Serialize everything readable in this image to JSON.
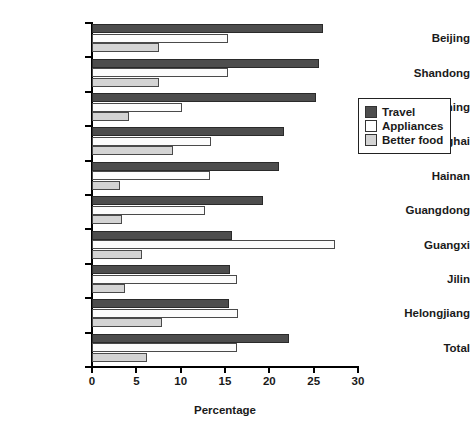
{
  "chart_data": {
    "type": "bar",
    "orientation": "horizontal",
    "title": "",
    "xlabel": "Percentage",
    "ylabel": "",
    "xlim": [
      0,
      30
    ],
    "xticks": [
      0,
      5,
      10,
      15,
      20,
      25,
      30
    ],
    "grid": false,
    "legend_position": "right",
    "categories": [
      "Beijing",
      "Shandong",
      "Liaoning",
      "Shanghai",
      "Hainan",
      "Guangdong",
      "Guangxi",
      "Jilin",
      "Helongjiang",
      "Total"
    ],
    "series": [
      {
        "name": "Travel",
        "color": "#4d4d4d",
        "values": [
          26.0,
          25.6,
          25.3,
          21.6,
          21.1,
          19.3,
          15.8,
          15.6,
          15.4,
          22.2
        ]
      },
      {
        "name": "Appliances",
        "color": "#fcfcfc",
        "values": [
          15.3,
          15.3,
          10.2,
          13.4,
          13.3,
          12.7,
          27.4,
          16.4,
          16.5,
          16.3
        ]
      },
      {
        "name": "Better food",
        "color": "#d4d4d4",
        "values": [
          7.5,
          7.5,
          4.2,
          9.1,
          3.2,
          3.4,
          5.6,
          3.7,
          7.9,
          6.2
        ]
      }
    ]
  },
  "legend": {
    "items": [
      {
        "label": "Travel",
        "swatch": "travel"
      },
      {
        "label": "Appliances",
        "swatch": "appliances"
      },
      {
        "label": "Better food",
        "swatch": "better"
      }
    ]
  },
  "axis": {
    "x_title": "Percentage"
  }
}
